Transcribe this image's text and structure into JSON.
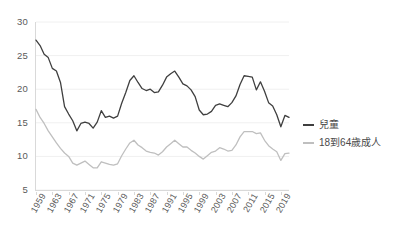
{
  "chart_data": {
    "type": "line",
    "title": "",
    "subtitle": "",
    "xlabel": "",
    "ylabel": "",
    "xlim": [
      1959,
      2021
    ],
    "ylim": [
      5,
      30
    ],
    "yticks": [
      5,
      10,
      15,
      20,
      25,
      30
    ],
    "xticks": [
      1959,
      1963,
      1967,
      1971,
      1975,
      1979,
      1983,
      1987,
      1991,
      1995,
      1999,
      2003,
      2007,
      2011,
      2015,
      2019
    ],
    "grid": "horizontal",
    "legend_position": "right",
    "x": [
      1959,
      1960,
      1961,
      1962,
      1963,
      1964,
      1965,
      1966,
      1967,
      1968,
      1969,
      1970,
      1971,
      1972,
      1973,
      1974,
      1975,
      1976,
      1977,
      1978,
      1979,
      1980,
      1981,
      1982,
      1983,
      1984,
      1985,
      1986,
      1987,
      1988,
      1989,
      1990,
      1991,
      1992,
      1993,
      1994,
      1995,
      1996,
      1997,
      1998,
      1999,
      2000,
      2001,
      2002,
      2003,
      2004,
      2005,
      2006,
      2007,
      2008,
      2009,
      2010,
      2011,
      2012,
      2013,
      2014,
      2015,
      2016,
      2017,
      2018,
      2019,
      2020,
      2021
    ],
    "series": [
      {
        "name": "兒童",
        "color": "#3f3f3f",
        "values": [
          27.3,
          26.5,
          25.2,
          24.7,
          23.1,
          22.7,
          21.0,
          17.4,
          16.3,
          15.3,
          13.8,
          14.9,
          15.1,
          14.9,
          14.2,
          15.1,
          16.8,
          15.8,
          16.0,
          15.7,
          16.0,
          17.9,
          19.5,
          21.3,
          22.0,
          21.0,
          20.1,
          19.8,
          20.0,
          19.5,
          19.6,
          20.6,
          21.8,
          22.3,
          22.7,
          21.8,
          20.8,
          20.5,
          19.9,
          18.9,
          16.9,
          16.2,
          16.3,
          16.7,
          17.6,
          17.8,
          17.6,
          17.4,
          18.0,
          19.0,
          20.7,
          22.0,
          21.9,
          21.8,
          19.9,
          21.1,
          19.7,
          18.0,
          17.5,
          16.2,
          14.4,
          16.1,
          15.8
        ]
      },
      {
        "name": "18到64歲成人",
        "color": "#bfbfbf",
        "values": [
          17.0,
          15.8,
          14.9,
          13.8,
          12.9,
          12.0,
          11.2,
          10.5,
          10.0,
          9.0,
          8.7,
          9.0,
          9.3,
          8.8,
          8.3,
          8.3,
          9.2,
          9.0,
          8.8,
          8.7,
          8.9,
          10.1,
          11.1,
          12.0,
          12.4,
          11.7,
          11.3,
          10.8,
          10.6,
          10.5,
          10.2,
          10.7,
          11.4,
          11.9,
          12.4,
          11.9,
          11.4,
          11.4,
          10.9,
          10.5,
          10.0,
          9.6,
          10.1,
          10.6,
          10.8,
          11.3,
          11.1,
          10.8,
          10.9,
          11.7,
          12.9,
          13.7,
          13.7,
          13.7,
          13.4,
          13.5,
          12.4,
          11.6,
          11.1,
          10.7,
          9.4,
          10.4,
          10.5
        ]
      }
    ]
  },
  "axes": {
    "y_tick_labels": [
      "30",
      "25",
      "20",
      "15",
      "10",
      "5"
    ],
    "x_tick_labels": [
      "1959",
      "1963",
      "1967",
      "1971",
      "1975",
      "1979",
      "1983",
      "1987",
      "1991",
      "1995",
      "1999",
      "2003",
      "2007",
      "2011",
      "2015",
      "2019"
    ]
  },
  "legend": {
    "items": [
      {
        "label": "兒童",
        "color": "#3f3f3f"
      },
      {
        "label": "18到64歲成人",
        "color": "#bfbfbf"
      }
    ]
  },
  "colors": {
    "background": "#ffffff",
    "gridline": "#f0f0f0",
    "axis": "#d9d9d9",
    "text": "#595959",
    "series_children": "#3f3f3f",
    "series_adults": "#bfbfbf"
  }
}
